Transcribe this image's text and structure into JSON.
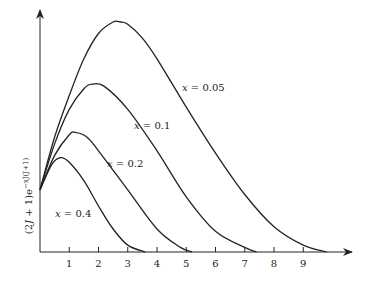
{
  "chart_data": {
    "type": "line",
    "title": "",
    "xlabel": "",
    "ylabel": "(2J + 1)e^{-xJ(J+1)}",
    "ylabel_parts": {
      "base": "(2",
      "J": "J",
      "mid": " + 1)e",
      "exp": "−xJ(J+1)"
    },
    "x_ticks": [
      "1",
      "2",
      "3",
      "4",
      "5",
      "6",
      "7",
      "8",
      "9"
    ],
    "xlim": [
      0,
      10.8
    ],
    "grid": false,
    "legend": "inline labels",
    "series": [
      {
        "name": "x = 0.05",
        "label_var": "x",
        "label_val": " = 0.05",
        "peak_x": 2.7,
        "peak_rel_height": 1.0,
        "end_x": 9.8,
        "points": [
          [
            0,
            0.27
          ],
          [
            0.5,
            0.5
          ],
          [
            1,
            0.68
          ],
          [
            1.5,
            0.84
          ],
          [
            2,
            0.95
          ],
          [
            2.5,
            1.0
          ],
          [
            2.75,
            1.0
          ],
          [
            3,
            0.99
          ],
          [
            3.5,
            0.93
          ],
          [
            4,
            0.84
          ],
          [
            5,
            0.63
          ],
          [
            6,
            0.43
          ],
          [
            7,
            0.25
          ],
          [
            8,
            0.11
          ],
          [
            9,
            0.03
          ],
          [
            9.8,
            0.0
          ]
        ]
      },
      {
        "name": "x = 0.1",
        "label_var": "x",
        "label_val": " = 0.1",
        "peak_x": 1.8,
        "peak_rel_height": 0.73,
        "end_x": 7.4,
        "points": [
          [
            0,
            0.27
          ],
          [
            0.5,
            0.47
          ],
          [
            1,
            0.62
          ],
          [
            1.5,
            0.71
          ],
          [
            1.8,
            0.73
          ],
          [
            2.2,
            0.72
          ],
          [
            3,
            0.62
          ],
          [
            4,
            0.44
          ],
          [
            5,
            0.24
          ],
          [
            6,
            0.09
          ],
          [
            7,
            0.02
          ],
          [
            7.4,
            0.0
          ]
        ]
      },
      {
        "name": "x = 0.2",
        "label_var": "x",
        "label_val": " = 0.2",
        "peak_x": 1.2,
        "peak_rel_height": 0.52,
        "end_x": 5.2,
        "points": [
          [
            0,
            0.27
          ],
          [
            0.5,
            0.42
          ],
          [
            1,
            0.51
          ],
          [
            1.2,
            0.52
          ],
          [
            1.6,
            0.5
          ],
          [
            2,
            0.44
          ],
          [
            3,
            0.27
          ],
          [
            4,
            0.1
          ],
          [
            4.8,
            0.02
          ],
          [
            5.2,
            0.0
          ]
        ]
      },
      {
        "name": "x = 0.4",
        "label_var": "x",
        "label_val": " = 0.4",
        "peak_x": 0.7,
        "peak_rel_height": 0.41,
        "end_x": 3.6,
        "points": [
          [
            0,
            0.27
          ],
          [
            0.4,
            0.38
          ],
          [
            0.7,
            0.41
          ],
          [
            1,
            0.39
          ],
          [
            1.5,
            0.31
          ],
          [
            2,
            0.2
          ],
          [
            2.5,
            0.1
          ],
          [
            3,
            0.03
          ],
          [
            3.6,
            0.0
          ]
        ]
      }
    ]
  }
}
